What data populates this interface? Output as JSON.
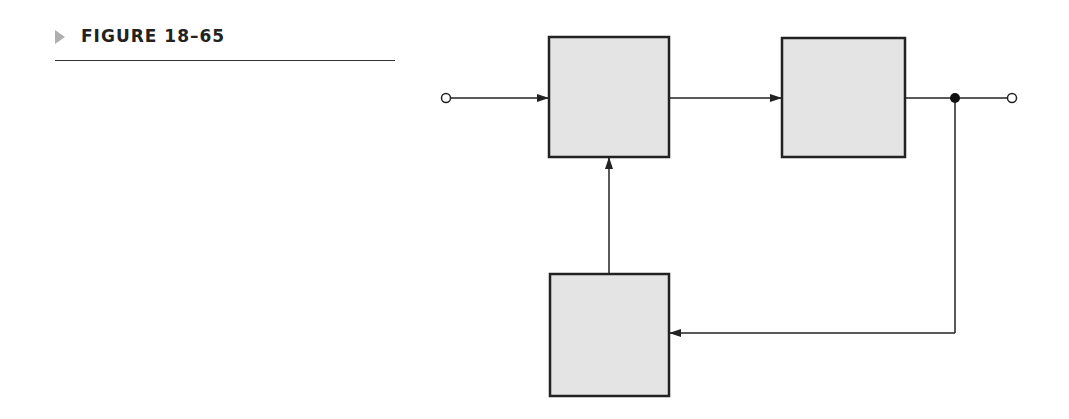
{
  "figure": {
    "label": "FIGURE 18–65",
    "marker_color": "#b0b0b0"
  },
  "diagram": {
    "type": "block-diagram-feedback",
    "block_fill": "#e4e4e4",
    "line_color": "#222222",
    "blocks": [
      {
        "id": "block-1",
        "label": "",
        "x": 549,
        "y": 37,
        "w": 120,
        "h": 120
      },
      {
        "id": "block-2",
        "label": "",
        "x": 782,
        "y": 38,
        "w": 123,
        "h": 119
      },
      {
        "id": "block-3",
        "label": "",
        "x": 550,
        "y": 274,
        "w": 119,
        "h": 122
      }
    ],
    "terminals": [
      {
        "id": "input-terminal",
        "x": 446,
        "y": 98
      },
      {
        "id": "output-terminal",
        "x": 1012,
        "y": 98
      }
    ],
    "junction": {
      "x": 955,
      "y": 98
    }
  }
}
